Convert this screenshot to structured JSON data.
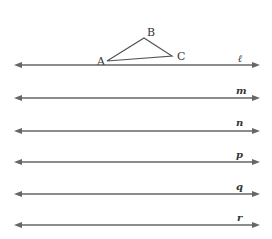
{
  "diagram": {
    "triangle": {
      "vertices": [
        {
          "label": "A",
          "x": 107,
          "y": 61
        },
        {
          "label": "B",
          "x": 144,
          "y": 38
        },
        {
          "label": "C",
          "x": 172,
          "y": 56
        }
      ]
    },
    "lines": [
      {
        "label": "ℓ",
        "y": 65
      },
      {
        "label": "m",
        "y": 98
      },
      {
        "label": "n",
        "y": 131
      },
      {
        "label": "p",
        "y": 162
      },
      {
        "label": "q",
        "y": 194
      },
      {
        "label": "r",
        "y": 225
      }
    ],
    "line_color": "#666666"
  }
}
